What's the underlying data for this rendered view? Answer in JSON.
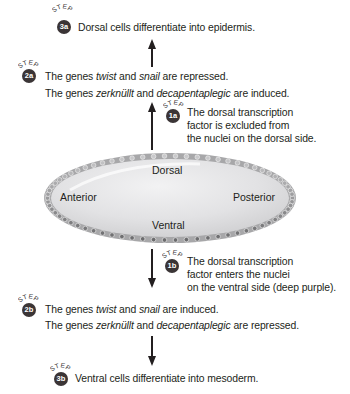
{
  "step_word": "STEP",
  "steps": {
    "s3a": {
      "badge": "3a",
      "text": "Dorsal cells differentiate into epidermis."
    },
    "s2a": {
      "badge": "2a",
      "line1": [
        "The genes ",
        "twist",
        " and ",
        "snail",
        " are repressed."
      ],
      "line2": [
        "The genes ",
        "zerknüllt",
        " and ",
        "decapentaplegic",
        " are induced."
      ]
    },
    "s1a": {
      "badge": "1a",
      "lines": [
        "The dorsal transcription",
        "factor is excluded from",
        "the nuclei on the dorsal side."
      ]
    },
    "s1b": {
      "badge": "1b",
      "lines": [
        "The dorsal transcription",
        "factor enters the nuclei",
        "on the ventral side (deep purple)."
      ]
    },
    "s2b": {
      "badge": "2b",
      "line1": [
        "The genes ",
        "twist",
        " and ",
        "snail",
        " are induced."
      ],
      "line2": [
        "The genes ",
        "zerknüllt",
        " and ",
        "decapentaplegic",
        " are repressed."
      ]
    },
    "s3b": {
      "badge": "3b",
      "text": "Ventral cells differentiate into mesoderm."
    }
  },
  "embryo": {
    "dorsal": "Dorsal",
    "ventral": "Ventral",
    "anterior": "Anterior",
    "posterior": "Posterior"
  },
  "colors": {
    "badge": "#3b3536",
    "embryo_fill": "#e4e4e6",
    "embryo_rim": "#9a9a9c",
    "nuclei_dorsal": "#c9c9cb",
    "nuclei_ventral": "#6b6b6d"
  }
}
